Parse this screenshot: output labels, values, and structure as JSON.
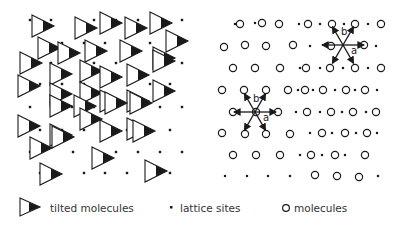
{
  "figure": {
    "left_panel": {
      "label": "tilted molecules on lattice",
      "triangles": [
        [
          32,
          15
        ],
        [
          75,
          17
        ],
        [
          100,
          12
        ],
        [
          125,
          17
        ],
        [
          150,
          12
        ],
        [
          38,
          37
        ],
        [
          58,
          42
        ],
        [
          85,
          40
        ],
        [
          120,
          40
        ],
        [
          153,
          47
        ],
        [
          166,
          30
        ],
        [
          20,
          52
        ],
        [
          50,
          63
        ],
        [
          80,
          60
        ],
        [
          100,
          66
        ],
        [
          127,
          64
        ],
        [
          153,
          50
        ],
        [
          18,
          75
        ],
        [
          50,
          83
        ],
        [
          80,
          82
        ],
        [
          100,
          90
        ],
        [
          127,
          90
        ],
        [
          153,
          80
        ],
        [
          50,
          95
        ],
        [
          74,
          95
        ],
        [
          105,
          92
        ],
        [
          130,
          92
        ],
        [
          18,
          115
        ],
        [
          50,
          124
        ],
        [
          80,
          108
        ],
        [
          100,
          120
        ],
        [
          127,
          118
        ],
        [
          133,
          120
        ],
        [
          30,
          137
        ],
        [
          52,
          126
        ],
        [
          92,
          147
        ],
        [
          40,
          163
        ],
        [
          145,
          160
        ]
      ],
      "lattice_dots": [
        [
          30,
          20
        ],
        [
          51,
          20
        ],
        [
          94,
          20
        ],
        [
          116,
          20
        ],
        [
          138,
          20
        ],
        [
          182,
          20
        ],
        [
          40,
          43
        ],
        [
          62,
          43
        ],
        [
          84,
          43
        ],
        [
          105,
          43
        ],
        [
          150,
          43
        ],
        [
          170,
          43
        ],
        [
          30,
          63
        ],
        [
          51,
          63
        ],
        [
          94,
          63
        ],
        [
          116,
          63
        ],
        [
          160,
          63
        ],
        [
          182,
          63
        ],
        [
          40,
          84
        ],
        [
          62,
          84
        ],
        [
          84,
          84
        ],
        [
          105,
          84
        ],
        [
          150,
          84
        ],
        [
          170,
          84
        ],
        [
          30,
          107
        ],
        [
          51,
          107
        ],
        [
          72,
          107
        ],
        [
          94,
          107
        ],
        [
          138,
          107
        ],
        [
          160,
          107
        ],
        [
          182,
          107
        ],
        [
          40,
          130
        ],
        [
          62,
          130
        ],
        [
          84,
          130
        ],
        [
          105,
          130
        ],
        [
          127,
          130
        ],
        [
          170,
          130
        ],
        [
          30,
          152
        ],
        [
          73,
          152
        ],
        [
          94,
          152
        ],
        [
          116,
          152
        ],
        [
          138,
          152
        ],
        [
          160,
          152
        ],
        [
          182,
          152
        ],
        [
          40,
          173
        ],
        [
          84,
          173
        ],
        [
          105,
          173
        ],
        [
          127,
          173
        ],
        [
          170,
          173
        ]
      ]
    },
    "right_panel": {
      "label": "molecules on lattice",
      "circles": [
        [
          240,
          24
        ],
        [
          262,
          23
        ],
        [
          279,
          24
        ],
        [
          308,
          24
        ],
        [
          332,
          24
        ],
        [
          355,
          24
        ],
        [
          381,
          24
        ],
        [
          224,
          47
        ],
        [
          245,
          45
        ],
        [
          266,
          46
        ],
        [
          293,
          45
        ],
        [
          331,
          46
        ],
        [
          364,
          45
        ],
        [
          233,
          68
        ],
        [
          255,
          68
        ],
        [
          280,
          68
        ],
        [
          306,
          68
        ],
        [
          330,
          68
        ],
        [
          355,
          68
        ],
        [
          381,
          68
        ],
        [
          222,
          90
        ],
        [
          244,
          90
        ],
        [
          266,
          90
        ],
        [
          288,
          90
        ],
        [
          305,
          90
        ],
        [
          323,
          90
        ],
        [
          346,
          90
        ],
        [
          365,
          90
        ],
        [
          233,
          112
        ],
        [
          256,
          112
        ],
        [
          278,
          112
        ],
        [
          307,
          112
        ],
        [
          331,
          112
        ],
        [
          353,
          112
        ],
        [
          376,
          112
        ],
        [
          222,
          133
        ],
        [
          245,
          134
        ],
        [
          266,
          134
        ],
        [
          290,
          134
        ],
        [
          322,
          133
        ],
        [
          345,
          133
        ],
        [
          367,
          133
        ],
        [
          233,
          155
        ],
        [
          256,
          155
        ],
        [
          280,
          155
        ],
        [
          311,
          155
        ],
        [
          335,
          155
        ],
        [
          365,
          155
        ],
        [
          315,
          175
        ],
        [
          337,
          176
        ],
        [
          359,
          177
        ]
      ],
      "lattice_dots": [
        [
          235,
          24
        ],
        [
          255,
          23
        ],
        [
          299,
          24
        ],
        [
          320,
          24
        ],
        [
          344,
          24
        ],
        [
          368,
          24
        ],
        [
          310,
          46
        ],
        [
          376,
          46
        ],
        [
          300,
          68
        ],
        [
          320,
          68
        ],
        [
          343,
          68
        ],
        [
          368,
          68
        ],
        [
          298,
          90
        ],
        [
          313,
          90
        ],
        [
          335,
          90
        ],
        [
          355,
          90
        ],
        [
          377,
          90
        ],
        [
          296,
          112
        ],
        [
          320,
          112
        ],
        [
          342,
          112
        ],
        [
          366,
          112
        ],
        [
          310,
          133
        ],
        [
          332,
          133
        ],
        [
          356,
          133
        ],
        [
          377,
          133
        ],
        [
          300,
          155
        ],
        [
          322,
          155
        ],
        [
          345,
          155
        ],
        [
          225,
          176
        ],
        [
          247,
          176
        ],
        [
          268,
          176
        ],
        [
          290,
          176
        ],
        [
          378,
          176
        ]
      ],
      "vector_stars": [
        {
          "cx": 343,
          "cy": 45,
          "label_a": "a",
          "label_b": "b"
        },
        {
          "cx": 255,
          "cy": 112,
          "label_a": "a",
          "label_b": "b"
        }
      ]
    },
    "legend": {
      "tilted_label": "tilted molecules",
      "lattice_label": "lattice sites",
      "molecules_label": "molecules"
    },
    "colors": {
      "ink": "#1a1a1a",
      "background": "#ffffff"
    }
  }
}
